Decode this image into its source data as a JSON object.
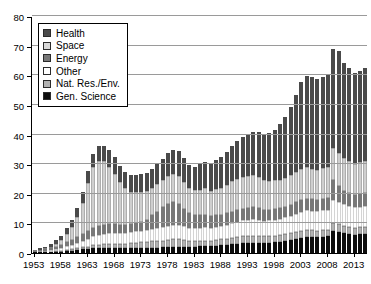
{
  "chart_data": {
    "type": "bar",
    "stacked": true,
    "title": "",
    "subtitle": "",
    "xlabel": "",
    "ylabel": "",
    "ylim": [
      0,
      80
    ],
    "ytick_labels": [
      "0",
      "10",
      "20",
      "30",
      "40",
      "50",
      "60",
      "70",
      "80"
    ],
    "yticks": [
      0,
      10,
      20,
      30,
      40,
      50,
      60,
      70,
      80
    ],
    "grid": true,
    "legend_position": "top-left",
    "xtick_labels": [
      "1953",
      "1958",
      "1963",
      "1968",
      "1973",
      "1978",
      "1983",
      "1988",
      "1993",
      "1998",
      "2003",
      "2008",
      "2013"
    ],
    "xticks": [
      1953,
      1958,
      1963,
      1968,
      1973,
      1978,
      1983,
      1988,
      1993,
      1998,
      2003,
      2008,
      2013
    ],
    "x": [
      1953,
      1954,
      1955,
      1956,
      1957,
      1958,
      1959,
      1960,
      1961,
      1962,
      1963,
      1964,
      1965,
      1966,
      1967,
      1968,
      1969,
      1970,
      1971,
      1972,
      1973,
      1974,
      1975,
      1976,
      1977,
      1978,
      1979,
      1980,
      1981,
      1982,
      1983,
      1984,
      1985,
      1986,
      1987,
      1988,
      1989,
      1990,
      1991,
      1992,
      1993,
      1994,
      1995,
      1996,
      1997,
      1998,
      1999,
      2000,
      2001,
      2002,
      2003,
      2004,
      2005,
      2006,
      2007,
      2008,
      2009,
      2010,
      2011,
      2012,
      2013,
      2014,
      2015
    ],
    "colors": {
      "health": "#4a4a4a",
      "space": "#cfcfcf",
      "energy": "#787878",
      "other": "#ffffff",
      "natres": "#b3b3b3",
      "gensci": "#0d0d0d"
    },
    "series": [
      {
        "name": "Gen. Science",
        "key": "gensci",
        "color": "#0d0d0d",
        "values": [
          0.2,
          0.2,
          0.3,
          0.3,
          0.4,
          0.5,
          0.7,
          0.8,
          1.0,
          1.2,
          1.4,
          1.6,
          1.7,
          1.8,
          1.8,
          1.8,
          1.7,
          1.7,
          1.7,
          1.7,
          1.7,
          1.7,
          1.8,
          1.8,
          1.9,
          2.0,
          2.1,
          2.1,
          2.0,
          2.0,
          2.1,
          2.2,
          2.3,
          2.3,
          2.5,
          2.7,
          2.8,
          3.0,
          3.2,
          3.3,
          3.4,
          3.5,
          3.5,
          3.4,
          3.5,
          3.6,
          3.8,
          4.0,
          4.3,
          4.6,
          5.0,
          5.3,
          5.4,
          5.3,
          5.5,
          5.6,
          7.4,
          7.0,
          6.6,
          6.4,
          6.2,
          6.3,
          6.4
        ]
      },
      {
        "name": "Nat. Res./Env.",
        "key": "natres",
        "color": "#b3b3b3",
        "values": [
          0.1,
          0.1,
          0.1,
          0.2,
          0.2,
          0.3,
          0.4,
          0.5,
          0.6,
          0.7,
          0.8,
          1.0,
          1.1,
          1.2,
          1.3,
          1.4,
          1.4,
          1.5,
          1.6,
          1.8,
          1.9,
          2.0,
          2.1,
          2.2,
          2.3,
          2.4,
          2.5,
          2.5,
          2.3,
          2.0,
          1.9,
          1.9,
          1.9,
          1.8,
          1.9,
          1.9,
          2.0,
          2.1,
          2.2,
          2.3,
          2.3,
          2.4,
          2.3,
          2.2,
          2.2,
          2.2,
          2.2,
          2.3,
          2.3,
          2.4,
          2.4,
          2.4,
          2.3,
          2.3,
          2.3,
          2.3,
          2.8,
          2.7,
          2.6,
          2.5,
          2.4,
          2.4,
          2.4
        ]
      },
      {
        "name": "Other",
        "key": "other",
        "color": "#ffffff",
        "values": [
          0.2,
          0.3,
          0.4,
          0.5,
          0.7,
          0.9,
          1.2,
          1.5,
          1.9,
          2.3,
          2.7,
          3.1,
          3.3,
          3.5,
          3.6,
          3.6,
          3.6,
          3.6,
          3.7,
          3.8,
          3.9,
          4.0,
          4.2,
          4.4,
          4.6,
          4.8,
          5.0,
          5.0,
          4.7,
          4.4,
          4.3,
          4.4,
          4.5,
          4.4,
          4.5,
          4.6,
          4.8,
          5.0,
          5.2,
          5.4,
          5.5,
          5.5,
          5.4,
          5.3,
          5.3,
          5.4,
          5.5,
          5.7,
          6.0,
          6.3,
          6.6,
          6.7,
          6.6,
          6.5,
          6.6,
          6.7,
          7.8,
          7.6,
          7.3,
          7.1,
          6.9,
          7.0,
          7.1
        ]
      },
      {
        "name": "Energy",
        "key": "energy",
        "color": "#787878",
        "values": [
          0.3,
          0.4,
          0.5,
          0.7,
          0.9,
          1.1,
          1.4,
          1.7,
          2.0,
          2.3,
          2.6,
          2.8,
          2.9,
          3.0,
          3.0,
          2.9,
          2.8,
          2.7,
          2.7,
          2.8,
          3.0,
          3.6,
          4.6,
          5.6,
          6.6,
          7.4,
          7.6,
          7.0,
          6.0,
          5.0,
          4.4,
          4.3,
          4.3,
          4.0,
          3.9,
          3.8,
          3.8,
          3.9,
          3.9,
          4.0,
          4.0,
          4.0,
          3.9,
          3.7,
          3.6,
          3.6,
          3.6,
          3.6,
          3.7,
          3.8,
          3.9,
          3.9,
          3.8,
          3.8,
          3.9,
          4.0,
          6.5,
          5.2,
          4.6,
          4.3,
          4.1,
          4.2,
          4.3
        ]
      },
      {
        "name": "Space",
        "key": "space",
        "color": "#cfcfcf",
        "values": [
          0.1,
          0.2,
          0.3,
          0.5,
          0.9,
          1.5,
          2.6,
          4.2,
          6.5,
          10.5,
          16.0,
          20.5,
          22.0,
          21.5,
          19.5,
          17.0,
          14.5,
          12.5,
          11.0,
          10.5,
          10.0,
          9.5,
          9.3,
          9.2,
          9.3,
          9.5,
          9.6,
          9.5,
          9.0,
          8.6,
          8.5,
          8.6,
          8.8,
          8.6,
          8.8,
          9.0,
          9.5,
          10.2,
          10.6,
          10.8,
          10.9,
          10.8,
          10.5,
          10.0,
          9.8,
          9.7,
          9.7,
          9.8,
          10.0,
          10.2,
          10.5,
          10.6,
          10.4,
          10.3,
          10.4,
          10.5,
          11.0,
          11.2,
          11.0,
          10.8,
          10.6,
          10.7,
          10.8
        ]
      },
      {
        "name": "Health",
        "key": "health",
        "color": "#4a4a4a",
        "values": [
          0.3,
          0.4,
          0.6,
          0.9,
          1.2,
          1.6,
          2.1,
          2.6,
          3.1,
          3.6,
          4.1,
          4.6,
          5.0,
          5.3,
          5.5,
          5.6,
          5.5,
          5.5,
          5.6,
          5.9,
          6.1,
          6.3,
          6.5,
          6.8,
          7.2,
          7.6,
          8.0,
          8.2,
          8.0,
          7.8,
          8.0,
          8.5,
          9.0,
          9.2,
          9.8,
          10.5,
          11.2,
          12.0,
          12.8,
          13.5,
          14.2,
          14.8,
          15.3,
          15.5,
          16.2,
          17.2,
          18.8,
          20.5,
          23.0,
          26.0,
          29.5,
          31.0,
          31.0,
          30.5,
          30.8,
          31.0,
          33.5,
          34.5,
          32.0,
          31.5,
          30.5,
          31.0,
          31.5
        ]
      }
    ]
  },
  "legend": {
    "items": [
      {
        "label": "Health",
        "key": "health"
      },
      {
        "label": "Space",
        "key": "space"
      },
      {
        "label": "Energy",
        "key": "energy"
      },
      {
        "label": "Other",
        "key": "other"
      },
      {
        "label": "Nat. Res./Env.",
        "key": "natres"
      },
      {
        "label": "Gen. Science",
        "key": "gensci"
      }
    ]
  }
}
